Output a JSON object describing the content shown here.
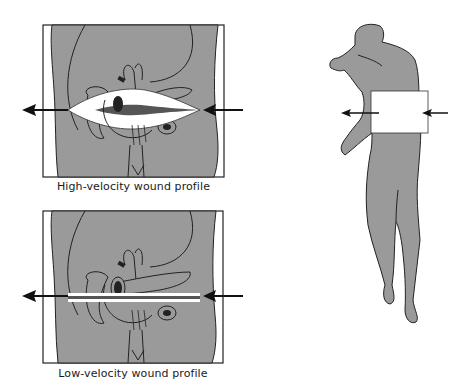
{
  "figure": {
    "panels": [
      {
        "id": "high-velocity",
        "caption": "High-velocity wound profile",
        "cavity": "large-temporary-cavity"
      },
      {
        "id": "low-velocity",
        "caption": "Low-velocity wound profile",
        "cavity": "narrow-permanent-track"
      }
    ],
    "body_figure": {
      "description": "human-silhouette-with-abdominal-region-highlighted",
      "arrows": [
        "entry-arrow-right",
        "exit-arrow-left"
      ]
    },
    "colors": {
      "tissue_gray": "#9a9a9a",
      "outline": "#1e1e1e",
      "cavity_white": "#ffffff",
      "arrow": "#111111",
      "track_dark": "#555555"
    }
  }
}
